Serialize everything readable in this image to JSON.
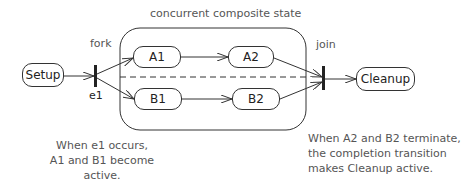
{
  "diagram": {
    "composite_state_label": "concurrent composite state",
    "fork_label": "fork",
    "join_label": "join",
    "event_label": "e1",
    "states": {
      "setup": "Setup",
      "a1": "A1",
      "a2": "A2",
      "b1": "B1",
      "b2": "B2",
      "cleanup": "Cleanup"
    },
    "notes": {
      "left": [
        "When e1 occurs,",
        "A1 and B1 become active."
      ],
      "right": [
        "When A2 and B2 terminate,",
        "the completion transition",
        "makes Cleanup active."
      ]
    },
    "colors": {
      "line": "#333333",
      "text": "#555555"
    }
  }
}
